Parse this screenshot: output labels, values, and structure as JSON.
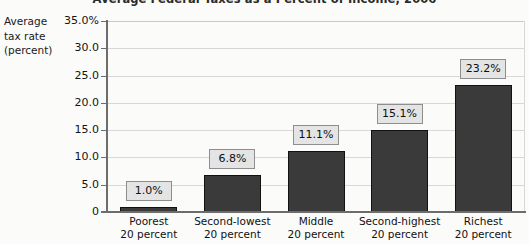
{
  "chart_data": {
    "type": "bar",
    "title": "Average Federal Taxes as a Percent of Income, 2006",
    "xlabel": "",
    "ylabel": "Average tax rate (percent)",
    "ylabel_lines": [
      "Average",
      "tax rate",
      "(percent)"
    ],
    "categories": [
      "Poorest 20 percent",
      "Second-lowest 20 percent",
      "Middle 20 percent",
      "Second-highest 20 percent",
      "Richest 20 percent"
    ],
    "category_lines": [
      {
        "line1": "Poorest",
        "line2": "20 percent"
      },
      {
        "line1": "Second-lowest",
        "line2": "20 percent"
      },
      {
        "line1": "Middle",
        "line2": "20 percent"
      },
      {
        "line1": "Second-highest",
        "line2": "20 percent"
      },
      {
        "line1": "Richest",
        "line2": "20 percent"
      }
    ],
    "values": [
      1.0,
      6.8,
      11.1,
      15.1,
      23.2
    ],
    "data_labels": [
      "1.0%",
      "6.8%",
      "11.1%",
      "15.1%",
      "23.2%"
    ],
    "ylim": [
      0,
      35
    ],
    "ytick_values": [
      35.0,
      30.0,
      25.0,
      20.0,
      15.0,
      10.0,
      5.0,
      0
    ],
    "ytick_labels": [
      "35.0%",
      "30.0",
      "25.0",
      "20.0",
      "15.0",
      "10.0",
      "5.0",
      "0"
    ],
    "grid": true,
    "legend": "none",
    "bar_color": "#3a3a3a",
    "label_box_fill": "#e4e4e4",
    "label_box_border": "#8e8e8e",
    "gridline_color": "#d8d8d8",
    "axis_color": "#6d6d6d",
    "background": "#fbfbfa"
  }
}
